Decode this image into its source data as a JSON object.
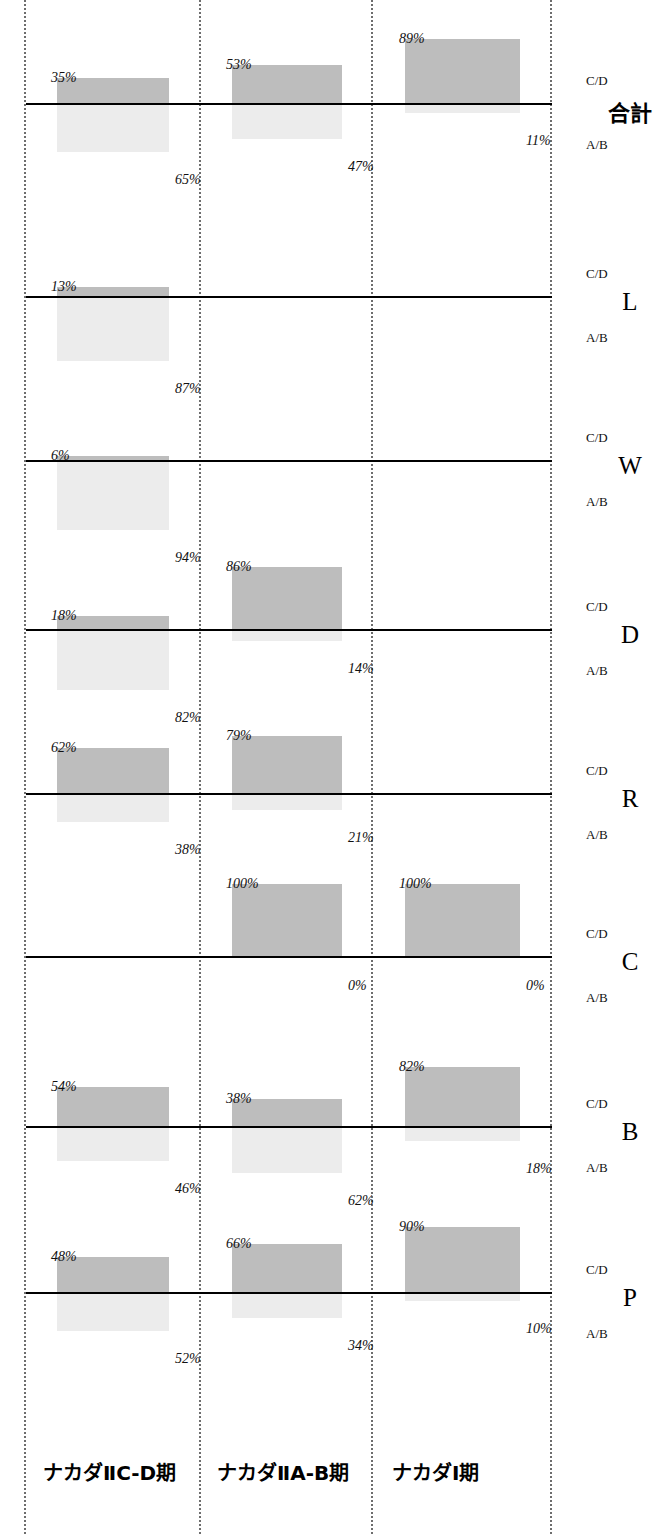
{
  "figure": {
    "orientation": "rotated-90",
    "value_suffix": "%",
    "colors": {
      "series_ab": "#bdbdbd",
      "series_cd": "#ececec",
      "baseline": "#000000",
      "separator": "#6d6d6d"
    }
  },
  "axis": {
    "sub_labels": {
      "ab": "A/B",
      "cd": "C/D"
    },
    "category_labels": [
      "P",
      "B",
      "C",
      "R",
      "D",
      "W",
      "L",
      "合計"
    ]
  },
  "groups": [
    {
      "id": "g1",
      "label": "ナカダⅠ期"
    },
    {
      "id": "g2",
      "label": "ナカダⅡA-B期"
    },
    {
      "id": "g3",
      "label": "ナカダⅡC-D期"
    }
  ],
  "chart_data": {
    "type": "bar",
    "title": "",
    "xlabel": "",
    "ylabel": "",
    "ylim": [
      -100,
      100
    ],
    "grid": false,
    "legend_position": "none",
    "note": "Diverging bar chart. For each category and each period group, the A/B share is drawn on one side of the zero baseline and the C/D share on the other. Values are percentages summing to 100 per category/group pair.",
    "categories": [
      "P",
      "B",
      "C",
      "R",
      "D",
      "W",
      "L",
      "合計"
    ],
    "groups": [
      "ナカダⅠ期",
      "ナカダⅡA-B期",
      "ナカダⅡC-D期"
    ],
    "series": [
      {
        "name": "A/B",
        "values": {
          "ナカダⅠ期": [
            90,
            82,
            100,
            null,
            null,
            null,
            null,
            89
          ],
          "ナカダⅡA-B期": [
            66,
            38,
            100,
            79,
            86,
            null,
            null,
            53
          ],
          "ナカダⅡC-D期": [
            48,
            54,
            null,
            62,
            18,
            6,
            13,
            35
          ]
        }
      },
      {
        "name": "C/D",
        "values": {
          "ナカダⅠ期": [
            10,
            18,
            0,
            null,
            null,
            null,
            null,
            11
          ],
          "ナカダⅡA-B期": [
            34,
            62,
            0,
            21,
            14,
            null,
            null,
            47
          ],
          "ナカダⅡC-D期": [
            52,
            46,
            null,
            38,
            82,
            94,
            87,
            65
          ]
        }
      }
    ],
    "data_labels": {
      "P": {
        "ナカダⅠ期": {
          "A/B": "90%",
          "C/D": "10%"
        },
        "ナカダⅡA-B期": {
          "A/B": "66%",
          "C/D": "34%"
        },
        "ナカダⅡC-D期": {
          "A/B": "48%",
          "C/D": "52%"
        }
      },
      "B": {
        "ナカダⅠ期": {
          "A/B": "82%",
          "C/D": "18%"
        },
        "ナカダⅡA-B期": {
          "A/B": "38%",
          "C/D": "62%"
        },
        "ナカダⅡC-D期": {
          "A/B": "54%",
          "C/D": "46%"
        }
      },
      "C": {
        "ナカダⅠ期": {
          "A/B": "100%",
          "C/D": "0%"
        },
        "ナカダⅡA-B期": {
          "A/B": "100%",
          "C/D": "0%"
        },
        "ナカダⅡC-D期": {
          "A/B": "",
          "C/D": ""
        }
      },
      "R": {
        "ナカダⅠ期": {
          "A/B": "",
          "C/D": ""
        },
        "ナカダⅡA-B期": {
          "A/B": "79%",
          "C/D": "21%"
        },
        "ナカダⅡC-D期": {
          "A/B": "62%",
          "C/D": "38%"
        }
      },
      "D": {
        "ナカダⅠ期": {
          "A/B": "",
          "C/D": ""
        },
        "ナカダⅡA-B期": {
          "A/B": "86%",
          "C/D": "14%"
        },
        "ナカダⅡC-D期": {
          "A/B": "18%",
          "C/D": "82%"
        }
      },
      "W": {
        "ナカダⅠ期": {
          "A/B": "",
          "C/D": ""
        },
        "ナカダⅡA-B期": {
          "A/B": "",
          "C/D": ""
        },
        "ナカダⅡC-D期": {
          "A/B": "6%",
          "C/D": "94%"
        }
      },
      "L": {
        "ナカダⅠ期": {
          "A/B": "",
          "C/D": ""
        },
        "ナカダⅡA-B期": {
          "A/B": "",
          "C/D": ""
        },
        "ナカダⅡC-D期": {
          "A/B": "13%",
          "C/D": "87%"
        }
      },
      "合計": {
        "ナカダⅠ期": {
          "A/B": "89%",
          "C/D": "11%"
        },
        "ナカダⅡA-B期": {
          "A/B": "53%",
          "C/D": "47%"
        },
        "ナカダⅡC-D期": {
          "A/B": "35%",
          "C/D": "65%"
        }
      }
    }
  },
  "labels": {
    "cat_P": "P",
    "cat_B": "B",
    "cat_C": "C",
    "cat_R": "R",
    "cat_D": "D",
    "cat_W": "W",
    "cat_L": "L",
    "cat_total": "合計",
    "ab": "A/B",
    "cd": "C/D",
    "group1": "ナカダⅠ期",
    "group2": "ナカダⅡA-B期",
    "group3": "ナカダⅡC-D期",
    "P_g1_ab": "90%",
    "P_g1_cd": "10%",
    "P_g2_ab": "66%",
    "P_g2_cd": "34%",
    "P_g3_ab": "48%",
    "P_g3_cd": "52%",
    "B_g1_ab": "82%",
    "B_g1_cd": "18%",
    "B_g2_ab": "38%",
    "B_g2_cd": "62%",
    "B_g3_ab": "54%",
    "B_g3_cd": "46%",
    "C_g1_ab": "100%",
    "C_g1_cd": "0%",
    "C_g2_ab": "100%",
    "C_g2_cd": "0%",
    "R_g2_ab": "79%",
    "R_g2_cd": "21%",
    "R_g3_ab": "62%",
    "R_g3_cd": "38%",
    "D_g2_ab": "86%",
    "D_g2_cd": "14%",
    "D_g3_ab": "18%",
    "D_g3_cd": "82%",
    "W_g3_ab": "6%",
    "W_g3_cd": "94%",
    "L_g3_ab": "13%",
    "L_g3_cd": "87%",
    "T_g1_ab": "89%",
    "T_g1_cd": "11%",
    "T_g2_ab": "53%",
    "T_g2_cd": "47%",
    "T_g3_ab": "35%",
    "T_g3_cd": "65%"
  }
}
